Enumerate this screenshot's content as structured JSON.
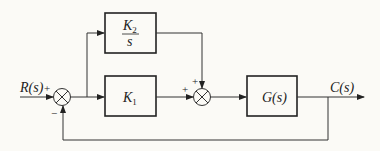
{
  "diagram": {
    "type": "block-diagram",
    "input": {
      "label": "R(s)"
    },
    "output": {
      "label": "C(s)"
    },
    "blocks": [
      {
        "id": "k2",
        "label_num": "K",
        "label_num_sub": "2",
        "label_den": "s"
      },
      {
        "id": "k1",
        "label": "K",
        "label_sub": "1"
      },
      {
        "id": "g",
        "label": "G(s)"
      }
    ],
    "summing_junctions": [
      {
        "id": "sum1",
        "signs": {
          "input": "+",
          "feedback": "−"
        }
      },
      {
        "id": "sum2",
        "signs": {
          "k1": "+",
          "k2": "+"
        }
      }
    ],
    "feedback": "unity negative feedback from C(s) to sum1"
  }
}
